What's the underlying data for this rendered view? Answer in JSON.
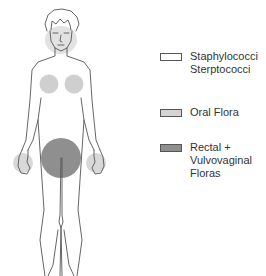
{
  "legend": {
    "items": [
      {
        "id": "staph",
        "lines": [
          "Staphylococci",
          "Sterptococci"
        ],
        "color": "#ffffff"
      },
      {
        "id": "oral",
        "lines": [
          "Oral Flora"
        ],
        "color": "#d4d4d4"
      },
      {
        "id": "rectal",
        "lines": [
          "Rectal +",
          "Vulvovaginal",
          "Floras"
        ],
        "color": "#8f8f8f"
      }
    ]
  },
  "figure": {
    "regions": [
      {
        "name": "face",
        "flora": "oral"
      },
      {
        "name": "chest-left",
        "flora": "oral"
      },
      {
        "name": "chest-right",
        "flora": "oral"
      },
      {
        "name": "hand-left",
        "flora": "oral"
      },
      {
        "name": "hand-right",
        "flora": "oral"
      },
      {
        "name": "perineum",
        "flora": "rectal"
      }
    ],
    "colors": {
      "outline": "#555555",
      "oral": "#cfcfcf",
      "rectal": "#8f8f8f"
    }
  }
}
